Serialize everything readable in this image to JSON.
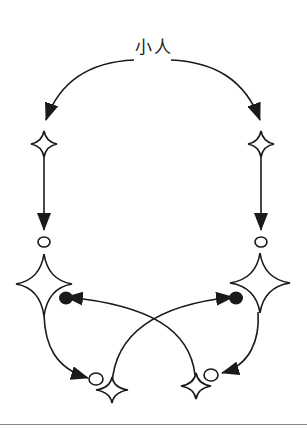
{
  "diagram": {
    "title": "小人",
    "colors": {
      "stroke": "#1a1a1a",
      "background": "#ffffff",
      "rule": "#8a8a8a"
    },
    "nodes": [
      {
        "id": "left-small-star",
        "shape": "four-point-star",
        "size": "small"
      },
      {
        "id": "left-open-circle",
        "shape": "open-circle"
      },
      {
        "id": "left-big-star",
        "shape": "four-point-star",
        "size": "large"
      },
      {
        "id": "left-filled-dot",
        "shape": "filled-circle"
      },
      {
        "id": "left-bottom-open-circle",
        "shape": "open-circle"
      },
      {
        "id": "left-bottom-star",
        "shape": "four-point-star",
        "size": "small"
      },
      {
        "id": "right-small-star",
        "shape": "four-point-star",
        "size": "small"
      },
      {
        "id": "right-open-circle",
        "shape": "open-circle"
      },
      {
        "id": "right-big-star",
        "shape": "four-point-star",
        "size": "large"
      },
      {
        "id": "right-filled-dot",
        "shape": "filled-circle"
      },
      {
        "id": "right-bottom-open-circle",
        "shape": "open-circle"
      },
      {
        "id": "right-bottom-star",
        "shape": "four-point-star",
        "size": "small"
      }
    ],
    "edges": [
      {
        "from": "title",
        "to": "left-small-star",
        "style": "curved-arrow"
      },
      {
        "from": "title",
        "to": "right-small-star",
        "style": "curved-arrow"
      },
      {
        "from": "left-small-star",
        "to": "left-open-circle",
        "style": "straight-arrow"
      },
      {
        "from": "right-small-star",
        "to": "right-open-circle",
        "style": "straight-arrow"
      },
      {
        "from": "left-big-star",
        "to": "left-bottom-open-circle",
        "style": "curved-arrow"
      },
      {
        "from": "right-big-star",
        "to": "right-bottom-open-circle",
        "style": "curved-arrow"
      },
      {
        "from": "right-bottom-star",
        "to": "left-filled-dot",
        "style": "curved-arrow-crossing"
      },
      {
        "from": "left-bottom-star",
        "to": "right-filled-dot",
        "style": "curved-arrow-crossing"
      }
    ]
  }
}
